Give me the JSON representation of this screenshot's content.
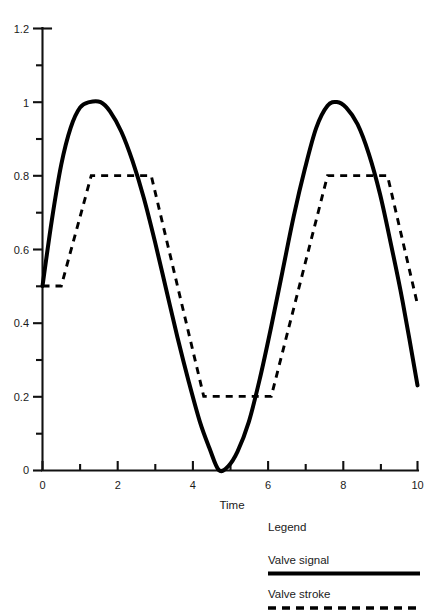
{
  "chart_data": {
    "type": "line",
    "title": "",
    "xlabel": "Time",
    "ylabel": "",
    "xlim": [
      0,
      10
    ],
    "ylim": [
      0,
      1.2
    ],
    "grid": false,
    "x_ticks": [
      0,
      2,
      4,
      6,
      8,
      10
    ],
    "x_tick_labels": [
      "0",
      "2",
      "4",
      "6",
      "8",
      "10"
    ],
    "x_minor_ticks": [
      1,
      3,
      5,
      7,
      9
    ],
    "y_ticks": [
      0,
      0.2,
      0.4,
      0.6,
      0.8,
      1,
      1.2
    ],
    "y_tick_labels": [
      "0",
      "0.2",
      "0.4",
      "0.6",
      "0.8",
      "1",
      "1.2"
    ],
    "y_minor_ticks": [
      0.1,
      0.3,
      0.5,
      0.7,
      0.9,
      1.1
    ],
    "legend_position": "below-right",
    "legend_title": "Legend",
    "series": [
      {
        "name": "Valve signal",
        "style": "solid",
        "color": "#000000",
        "x": [
          0.0,
          0.25,
          0.5,
          0.75,
          1.0,
          1.25,
          1.55,
          1.8,
          2.1,
          2.4,
          2.7,
          3.0,
          3.3,
          3.6,
          3.9,
          4.2,
          4.45,
          4.7,
          4.95,
          5.2,
          5.5,
          5.8,
          6.1,
          6.4,
          6.7,
          7.0,
          7.3,
          7.6,
          7.85,
          8.1,
          8.4,
          8.7,
          9.0,
          9.3,
          9.6,
          10.0
        ],
        "y": [
          0.5,
          0.68,
          0.83,
          0.93,
          0.985,
          1.0,
          1.0,
          0.975,
          0.92,
          0.84,
          0.74,
          0.62,
          0.49,
          0.36,
          0.24,
          0.13,
          0.06,
          0.0,
          0.01,
          0.05,
          0.13,
          0.25,
          0.39,
          0.54,
          0.69,
          0.82,
          0.93,
          0.99,
          1.0,
          0.985,
          0.94,
          0.86,
          0.75,
          0.61,
          0.46,
          0.23
        ]
      },
      {
        "name": "Valve stroke",
        "style": "dashed",
        "color": "#000000",
        "x": [
          0.0,
          0.5,
          1.3,
          2.9,
          4.3,
          6.1,
          7.6,
          9.2,
          10.0
        ],
        "y": [
          0.5,
          0.5,
          0.8,
          0.8,
          0.2,
          0.2,
          0.8,
          0.8,
          0.45
        ]
      }
    ]
  },
  "axes": {
    "x_axis_name": "time-axis",
    "y_axis_name": "value-axis"
  },
  "legend": {
    "title": "Legend",
    "entries": [
      {
        "label": "Valve signal",
        "style": "solid"
      },
      {
        "label": "Valve stroke",
        "style": "dashed"
      }
    ]
  }
}
